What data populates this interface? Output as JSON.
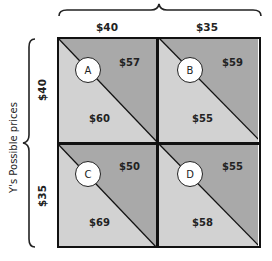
{
  "diagram": {
    "type": "payoff-matrix",
    "column_header": {
      "title": "",
      "labels": [
        "$40",
        "$35"
      ]
    },
    "row_header": {
      "title": "Y's Possible prices",
      "labels": [
        "$40",
        "$35"
      ]
    },
    "colors": {
      "upper_triangle": "#a9a9a9",
      "lower_triangle": "#d2d2d2",
      "border": "#111111",
      "circle_fill": "#ffffff"
    },
    "cells": [
      {
        "id": "A",
        "row": "$40",
        "col": "$40",
        "upper_value": "$57",
        "lower_value": "$60"
      },
      {
        "id": "B",
        "row": "$40",
        "col": "$35",
        "upper_value": "$59",
        "lower_value": "$55"
      },
      {
        "id": "C",
        "row": "$35",
        "col": "$40",
        "upper_value": "$50",
        "lower_value": "$69"
      },
      {
        "id": "D",
        "row": "$35",
        "col": "$35",
        "upper_value": "$55",
        "lower_value": "$58"
      }
    ]
  }
}
